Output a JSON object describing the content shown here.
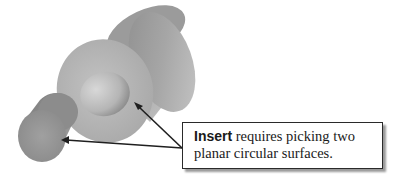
{
  "figure": {
    "type": "cad-illustration",
    "parts": [
      {
        "name": "large-cylinder",
        "feature": "bore with planar circular face"
      },
      {
        "name": "small-cylinder",
        "feature": "planar circular end face"
      }
    ],
    "colors": {
      "background": "#ffffff",
      "cylinder_body": "#a8a8a8",
      "cylinder_face": "#b9b9b9",
      "arrow": "#1f1f1f",
      "callout_border": "#2a2a2a",
      "callout_shadow": "#9a9a9a"
    }
  },
  "callout": {
    "keyword": "Insert",
    "text_line1_rest": " requires picking two",
    "text_line2": "planar circular surfaces."
  }
}
